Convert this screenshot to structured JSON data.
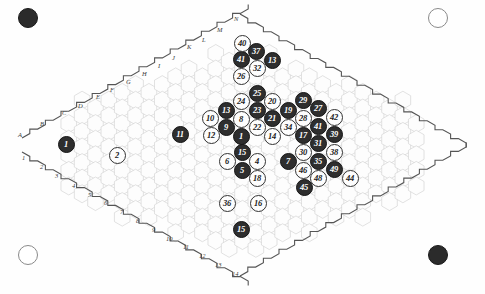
{
  "diagram": {
    "board_shape": "hexagonal-rhombus-grid",
    "background_color": "#fefefe",
    "grid_line_color": "#cfcfcf",
    "border_line_color": "#555555",
    "black_stone_color": "#2e2e2e",
    "white_stone_color": "#fdfdfd"
  },
  "corner_markers": [
    {
      "name": "top-left-marker",
      "color": "black",
      "x": 28,
      "y": 18
    },
    {
      "name": "top-right-marker",
      "color": "white",
      "x": 438,
      "y": 18
    },
    {
      "name": "bottom-left-marker",
      "color": "white",
      "x": 28,
      "y": 255
    },
    {
      "name": "bottom-right-marker",
      "color": "black",
      "x": 438,
      "y": 255
    }
  ],
  "edge_labels": {
    "letters": [
      {
        "text": "A",
        "x": 18,
        "y": 132
      },
      {
        "text": "B",
        "x": 40,
        "y": 121
      },
      {
        "text": "C",
        "x": 62,
        "y": 110
      },
      {
        "text": "D",
        "x": 78,
        "y": 103
      },
      {
        "text": "E",
        "x": 96,
        "y": 94
      },
      {
        "text": "F",
        "x": 110,
        "y": 87
      },
      {
        "text": "G",
        "x": 126,
        "y": 79
      },
      {
        "text": "H",
        "x": 142,
        "y": 71
      },
      {
        "text": "I",
        "x": 158,
        "y": 63
      },
      {
        "text": "J",
        "x": 172,
        "y": 55
      },
      {
        "text": "K",
        "x": 187,
        "y": 44
      },
      {
        "text": "L",
        "x": 202,
        "y": 37
      },
      {
        "text": "M",
        "x": 217,
        "y": 27
      },
      {
        "text": "N",
        "x": 234,
        "y": 16
      }
    ],
    "numbers": [
      {
        "text": "1",
        "x": 22,
        "y": 155
      },
      {
        "text": "2",
        "x": 40,
        "y": 164
      },
      {
        "text": "3",
        "x": 55,
        "y": 173
      },
      {
        "text": "4",
        "x": 72,
        "y": 183
      },
      {
        "text": "5",
        "x": 88,
        "y": 192
      },
      {
        "text": "6",
        "x": 104,
        "y": 200
      },
      {
        "text": "7",
        "x": 120,
        "y": 209
      },
      {
        "text": "8",
        "x": 136,
        "y": 218
      },
      {
        "text": "9",
        "x": 152,
        "y": 227
      },
      {
        "text": "10",
        "x": 166,
        "y": 236
      },
      {
        "text": "11",
        "x": 183,
        "y": 244
      },
      {
        "text": "12",
        "x": 199,
        "y": 253
      },
      {
        "text": "13",
        "x": 215,
        "y": 262
      },
      {
        "text": "14",
        "x": 232,
        "y": 271
      }
    ]
  },
  "stones": [
    {
      "label": "1",
      "color": "black",
      "x": 66,
      "y": 144
    },
    {
      "label": "2",
      "color": "white",
      "x": 117,
      "y": 155
    },
    {
      "label": "11",
      "color": "black",
      "x": 180,
      "y": 134
    },
    {
      "label": "10",
      "color": "white",
      "x": 210,
      "y": 118
    },
    {
      "label": "12",
      "color": "white",
      "x": 211,
      "y": 135
    },
    {
      "label": "13",
      "color": "black",
      "x": 226,
      "y": 110
    },
    {
      "label": "9",
      "color": "black",
      "x": 226,
      "y": 127
    },
    {
      "label": "1",
      "color": "black",
      "x": 241,
      "y": 136
    },
    {
      "label": "8",
      "color": "white",
      "x": 241,
      "y": 119
    },
    {
      "label": "24",
      "color": "white",
      "x": 241,
      "y": 101
    },
    {
      "label": "26",
      "color": "white",
      "x": 241,
      "y": 76
    },
    {
      "label": "41",
      "color": "black",
      "x": 241,
      "y": 59
    },
    {
      "label": "40",
      "color": "white",
      "x": 242,
      "y": 43
    },
    {
      "label": "37",
      "color": "black",
      "x": 256,
      "y": 51
    },
    {
      "label": "13",
      "color": "black",
      "x": 272,
      "y": 60
    },
    {
      "label": "32",
      "color": "white",
      "x": 257,
      "y": 68
    },
    {
      "label": "25",
      "color": "black",
      "x": 257,
      "y": 93
    },
    {
      "label": "23",
      "color": "black",
      "x": 257,
      "y": 110
    },
    {
      "label": "22",
      "color": "white",
      "x": 257,
      "y": 127
    },
    {
      "label": "15",
      "color": "black",
      "x": 242,
      "y": 152
    },
    {
      "label": "5",
      "color": "black",
      "x": 242,
      "y": 170
    },
    {
      "label": "6",
      "color": "white",
      "x": 227,
      "y": 161
    },
    {
      "label": "4",
      "color": "white",
      "x": 257,
      "y": 161
    },
    {
      "label": "18",
      "color": "white",
      "x": 257,
      "y": 178
    },
    {
      "label": "36",
      "color": "white",
      "x": 227,
      "y": 203
    },
    {
      "label": "16",
      "color": "white",
      "x": 258,
      "y": 203
    },
    {
      "label": "15",
      "color": "black",
      "x": 241,
      "y": 229
    },
    {
      "label": "20",
      "color": "white",
      "x": 272,
      "y": 101
    },
    {
      "label": "21",
      "color": "black",
      "x": 272,
      "y": 118
    },
    {
      "label": "14",
      "color": "white",
      "x": 272,
      "y": 136
    },
    {
      "label": "19",
      "color": "black",
      "x": 288,
      "y": 110
    },
    {
      "label": "34",
      "color": "white",
      "x": 288,
      "y": 127
    },
    {
      "label": "29",
      "color": "black",
      "x": 303,
      "y": 100
    },
    {
      "label": "28",
      "color": "white",
      "x": 303,
      "y": 118
    },
    {
      "label": "17",
      "color": "black",
      "x": 303,
      "y": 135
    },
    {
      "label": "30",
      "color": "white",
      "x": 303,
      "y": 152
    },
    {
      "label": "46",
      "color": "white",
      "x": 303,
      "y": 170
    },
    {
      "label": "45",
      "color": "black",
      "x": 304,
      "y": 187
    },
    {
      "label": "7",
      "color": "black",
      "x": 288,
      "y": 161
    },
    {
      "label": "27",
      "color": "black",
      "x": 318,
      "y": 108
    },
    {
      "label": "41",
      "color": "black",
      "x": 318,
      "y": 126
    },
    {
      "label": "31",
      "color": "black",
      "x": 318,
      "y": 143
    },
    {
      "label": "35",
      "color": "black",
      "x": 318,
      "y": 161
    },
    {
      "label": "48",
      "color": "white",
      "x": 318,
      "y": 178
    },
    {
      "label": "42",
      "color": "white",
      "x": 334,
      "y": 117
    },
    {
      "label": "39",
      "color": "black",
      "x": 334,
      "y": 134
    },
    {
      "label": "38",
      "color": "white",
      "x": 334,
      "y": 152
    },
    {
      "label": "49",
      "color": "black",
      "x": 334,
      "y": 169
    },
    {
      "label": "44",
      "color": "white",
      "x": 350,
      "y": 178
    }
  ]
}
